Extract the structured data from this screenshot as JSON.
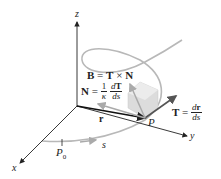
{
  "diagram": {
    "type": "3d-frenet-frame",
    "axes": {
      "x": "x",
      "y": "y",
      "z": "z"
    },
    "points": {
      "start": "P",
      "start_sub": "0",
      "current": "P"
    },
    "arc_length_label": "s",
    "position_vector_label": "r",
    "binormal": {
      "lhs": "B",
      "eq": "=",
      "rhs_a": "T",
      "op": "×",
      "rhs_b": "N"
    },
    "normal": {
      "lhs": "N",
      "eq": "=",
      "coef_num": "1",
      "coef_den": "κ",
      "frac_num_d": "d",
      "frac_num_v": "T",
      "frac_den": "ds"
    },
    "tangent": {
      "lhs": "T",
      "eq": "=",
      "frac_num_d": "d",
      "frac_num_v": "r",
      "frac_den": "ds"
    },
    "colors": {
      "axis": "#222222",
      "curve": "#b8b8b8",
      "vector_dark": "#555555",
      "vector_light": "#aaaaaa",
      "plane": "#d9d9d9"
    }
  }
}
